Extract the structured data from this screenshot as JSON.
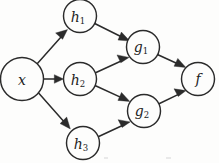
{
  "figure": {
    "background_color": "#fdfdfc",
    "ink_color": "#2b2b2b",
    "width": 219,
    "height": 163
  },
  "graph": {
    "type": "directed-acyclic-graph",
    "node_count": 7,
    "edge_count": 9,
    "nodes": [
      {
        "id": "x",
        "base": "x",
        "sub": "",
        "cx": 22,
        "cy": 79,
        "r": 21.5,
        "layer": 0
      },
      {
        "id": "h1",
        "base": "h",
        "sub": "1",
        "cx": 80,
        "cy": 16,
        "r": 16.5,
        "layer": 1
      },
      {
        "id": "h2",
        "base": "h",
        "sub": "2",
        "cx": 80,
        "cy": 79,
        "r": 16.5,
        "layer": 1
      },
      {
        "id": "h3",
        "base": "h",
        "sub": "3",
        "cx": 83,
        "cy": 143,
        "r": 16.5,
        "layer": 1
      },
      {
        "id": "g1",
        "base": "g",
        "sub": "1",
        "cx": 143,
        "cy": 47,
        "r": 16.5,
        "layer": 2
      },
      {
        "id": "g2",
        "base": "g",
        "sub": "2",
        "cx": 144,
        "cy": 111,
        "r": 16.5,
        "layer": 2
      },
      {
        "id": "f",
        "base": "f",
        "sub": "",
        "cx": 198,
        "cy": 79,
        "r": 16.5,
        "layer": 3
      }
    ],
    "edges": [
      {
        "id": "x-h1",
        "from": "x",
        "to": "h1",
        "label": ""
      },
      {
        "id": "x-h2",
        "from": "x",
        "to": "h2",
        "label": ""
      },
      {
        "id": "x-h3",
        "from": "x",
        "to": "h3",
        "label": ""
      },
      {
        "id": "h1-g1",
        "from": "h1",
        "to": "g1",
        "label": ""
      },
      {
        "id": "h2-g1",
        "from": "h2",
        "to": "g1",
        "label": ""
      },
      {
        "id": "h2-g2",
        "from": "h2",
        "to": "g2",
        "label": ""
      },
      {
        "id": "h3-g2",
        "from": "h3",
        "to": "g2",
        "label": ""
      },
      {
        "id": "g1-f",
        "from": "g1",
        "to": "f",
        "label": ""
      },
      {
        "id": "g2-f",
        "from": "g2",
        "to": "f",
        "label": ""
      }
    ]
  }
}
